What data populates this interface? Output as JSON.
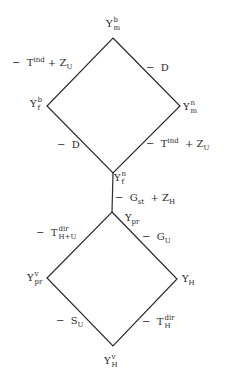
{
  "nodes": {
    "top": {
      "base": "Y",
      "sup": "b",
      "sub": "m"
    },
    "upper_left": {
      "base": "Y",
      "sup": "b",
      "sub": "f"
    },
    "upper_right": {
      "base": "Y",
      "sup": "n",
      "sub": "m"
    },
    "middle_top": {
      "base": "Y",
      "sup": "n",
      "sub": "f"
    },
    "middle_bottom": {
      "base": "Y",
      "sub": "pr"
    },
    "lower_left": {
      "base": "Y",
      "sup": "v",
      "sub": "pr"
    },
    "lower_right": {
      "base": "Y",
      "sub": "H"
    },
    "bottom": {
      "base": "Y",
      "sup": "v",
      "sub": "H"
    }
  },
  "edges": {
    "top_left": {
      "minus": "−",
      "t_base": "T",
      "t_sup": "ind",
      "plus": "+",
      "z_base": "Z",
      "z_sub": "U"
    },
    "top_right": {
      "minus": "−",
      "base": "D"
    },
    "mid_left": {
      "minus": "−",
      "base": "D"
    },
    "mid_right": {
      "minus": "−",
      "t_base": "T",
      "t_sup": "ind",
      "plus": "+",
      "z_base": "Z",
      "z_sub": "U"
    },
    "stem": {
      "minus": "−",
      "g_base": "G",
      "g_sub": "st",
      "plus": "+",
      "z_base": "Z",
      "z_sub": "H"
    },
    "low_upper_left": {
      "minus": "−",
      "base": "T",
      "sup": "dir",
      "sub": "H+U"
    },
    "low_upper_right": {
      "minus": "−",
      "base": "G",
      "sub": "U"
    },
    "low_lower_left": {
      "minus": "−",
      "base": "S",
      "sub": "U"
    },
    "low_lower_right": {
      "minus": "−",
      "base": "T",
      "sup": "dir",
      "sub": "H"
    }
  },
  "colors": {
    "line": "#2a2a2a",
    "background": "#ffffff"
  }
}
